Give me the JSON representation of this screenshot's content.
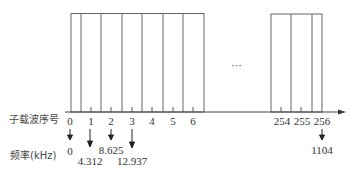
{
  "diagram": {
    "row_labels": {
      "subcarrier_index": "子载波序号",
      "frequency": "频率(kHz)"
    },
    "ellipsis": "···",
    "subcarrier_ticks": [
      {
        "label": "0"
      },
      {
        "label": "1"
      },
      {
        "label": "2"
      },
      {
        "label": "3"
      },
      {
        "label": "4"
      },
      {
        "label": "5"
      },
      {
        "label": "6"
      },
      {
        "label": "254"
      },
      {
        "label": "255"
      },
      {
        "label": "256"
      }
    ],
    "frequencies": [
      {
        "subcarrier": "0",
        "value": "0"
      },
      {
        "subcarrier": "1",
        "value": "4.312"
      },
      {
        "subcarrier": "2",
        "value": "8.625"
      },
      {
        "subcarrier": "3",
        "value": "12.937"
      },
      {
        "subcarrier": "256",
        "value": "1104"
      }
    ],
    "colors": {
      "line": "#555555",
      "text": "#333333"
    }
  }
}
